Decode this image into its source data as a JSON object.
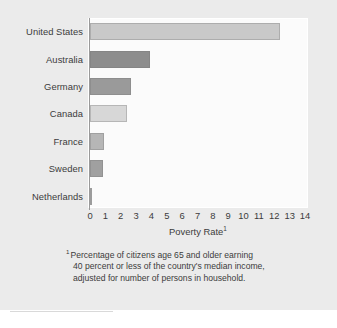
{
  "chart_data": {
    "type": "bar",
    "orientation": "horizontal",
    "title": "",
    "subtitle": "",
    "xlabel": "Poverty Rate",
    "xlabel_superscript": "1",
    "ylabel": "",
    "categories": [
      "United States",
      "Australia",
      "Germany",
      "Canada",
      "France",
      "Sweden",
      "Netherlands"
    ],
    "values": [
      12.4,
      3.9,
      2.7,
      2.4,
      0.9,
      0.85,
      0.05
    ],
    "xlim": [
      0,
      14
    ],
    "xticks": [
      0,
      1,
      2,
      3,
      4,
      5,
      6,
      7,
      8,
      9,
      10,
      11,
      12,
      13,
      14
    ],
    "xtick_labels": [
      "0",
      "1",
      "2",
      "3",
      "4",
      "5",
      "6",
      "7",
      "8",
      "9",
      "10",
      "11",
      "12",
      "13",
      "14"
    ],
    "grid": false,
    "legend": "none",
    "bar_colors": [
      "#c9c9c9",
      "#8d8d8d",
      "#9a9a9a",
      "#d7d7d7",
      "#b6b6b6",
      "#a0a0a0",
      "#9c9c9c"
    ],
    "background_color": "#ebebeb",
    "plot_background_color": "#fbfbfb",
    "axis_color": "#9a9a9a",
    "text_color": "#3b3b3b"
  },
  "footnote": {
    "marker": "1",
    "line1": "Percentage of citizens age 65 and older earning",
    "line2": "40 percent or less of the country's median income,",
    "line3": "adjusted for number of persons in household."
  }
}
